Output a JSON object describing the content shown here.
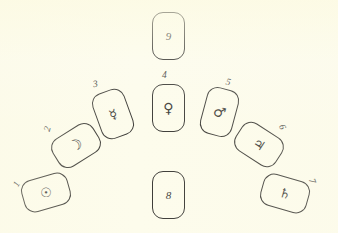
{
  "diagram": {
    "background_color": "#fdfcec",
    "ink_color": "#3b3a36",
    "card_count": 9,
    "cards": [
      {
        "number": "1",
        "symbol": "☉",
        "symbol_name": "sun-symbol",
        "label_rotation": -62,
        "card_rotation": -16,
        "x": 22,
        "y": 176,
        "width": 48,
        "height": 33,
        "label_x": 14,
        "label_y": 179,
        "glyph_class": "glyph-sun",
        "empty": false
      },
      {
        "number": "2",
        "symbol": "☽",
        "symbol_name": "moon-symbol",
        "label_rotation": -74,
        "card_rotation": -32,
        "x": 52,
        "y": 129,
        "width": 48,
        "height": 33,
        "label_x": 45,
        "label_y": 124,
        "glyph_class": "glyph-moon",
        "empty": false
      },
      {
        "number": "3",
        "symbol": "☿",
        "symbol_name": "mercury-symbol",
        "label_rotation": -10,
        "card_rotation": -20,
        "x": 96,
        "y": 90,
        "width": 34,
        "height": 48,
        "label_x": 93,
        "label_y": 79,
        "glyph_class": "glyph-mercury",
        "empty": false
      },
      {
        "number": "4",
        "symbol": "♀",
        "symbol_name": "venus-symbol",
        "label_rotation": 0,
        "card_rotation": 0,
        "x": 152,
        "y": 84,
        "width": 33,
        "height": 48,
        "label_x": 162,
        "label_y": 70,
        "glyph_class": "glyph-venus",
        "empty": false
      },
      {
        "number": "5",
        "symbol": "♂",
        "symbol_name": "mars-symbol",
        "label_rotation": 14,
        "card_rotation": 15,
        "x": 203,
        "y": 88,
        "width": 33,
        "height": 48,
        "label_x": 226,
        "label_y": 77,
        "glyph_class": "glyph-mars",
        "empty": false
      },
      {
        "number": "6",
        "symbol": "♃",
        "symbol_name": "jupiter-symbol",
        "label_rotation": 66,
        "card_rotation": 33,
        "x": 235,
        "y": 128,
        "width": 48,
        "height": 33,
        "label_x": 280,
        "label_y": 122,
        "glyph_class": "glyph-jupiter",
        "empty": false
      },
      {
        "number": "7",
        "symbol": "♄",
        "symbol_name": "saturn-symbol",
        "label_rotation": 70,
        "card_rotation": 16,
        "x": 261,
        "y": 177,
        "width": 48,
        "height": 33,
        "label_x": 310,
        "label_y": 176,
        "glyph_class": "glyph-saturn",
        "empty": false
      },
      {
        "number": "8",
        "symbol": "",
        "symbol_name": "empty-card",
        "label_rotation": 0,
        "card_rotation": 0,
        "x": 152,
        "y": 171,
        "width": 33,
        "height": 48,
        "label_x": 0,
        "label_y": 0,
        "glyph_class": "",
        "empty": true
      },
      {
        "number": "9",
        "symbol": "",
        "symbol_name": "empty-card",
        "label_rotation": 0,
        "card_rotation": 0,
        "x": 152,
        "y": 12,
        "width": 33,
        "height": 48,
        "label_x": 0,
        "label_y": 0,
        "glyph_class": "",
        "empty": true
      }
    ]
  }
}
